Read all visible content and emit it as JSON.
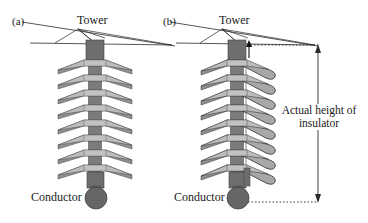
{
  "figure": {
    "type": "technical-diagram",
    "background_color": "#ffffff",
    "ink_color": "#1a1a1a"
  },
  "palette": {
    "shed_light": "#b9b9b9",
    "shed_dark": "#8f8f8f",
    "shed_mid": "#a6a6a6",
    "core_dark": "#6e6e6e",
    "core_mid": "#7b7b7b",
    "conductor": "#666666",
    "outline": "#3a3a3a",
    "dim_line": "#2b2b2b"
  },
  "panels": [
    {
      "id": "a",
      "tag": "(a)",
      "tower_label": "Tower",
      "conductor_label": "Conductor",
      "insulator_style": "disc-string-flat",
      "shed_count": 8,
      "center_x": 95
    },
    {
      "id": "b",
      "tag": "(b)",
      "tower_label": "Tower",
      "conductor_label": "Conductor",
      "insulator_style": "composite-curved-sheds",
      "shed_count": 8,
      "center_x": 237
    }
  ],
  "dimension": {
    "label_line1": "Actual height of",
    "label_line2": "insulator",
    "label_full": "Actual height of insulator",
    "arrow_style": "double-headed-vertical",
    "leader_style": "dotted",
    "x": 318,
    "top_y": 45,
    "bottom_y": 202
  }
}
